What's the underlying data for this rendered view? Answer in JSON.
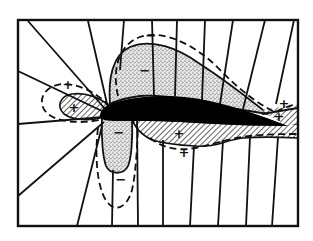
{
  "diagram": {
    "colors": {
      "ink": "#111111",
      "background": "#ffffff",
      "airfoil": "#000000"
    },
    "regions": [
      {
        "id": "upper-suction",
        "pattern": "stipple",
        "sign": "−"
      },
      {
        "id": "lower-front-suction",
        "pattern": "stipple",
        "sign": "−"
      },
      {
        "id": "leading-edge-pressure",
        "pattern": "hatch",
        "sign": "+"
      },
      {
        "id": "lower-pressure",
        "pattern": "hatch",
        "sign": "+"
      },
      {
        "id": "trailing-edge-pressure",
        "pattern": "hatch",
        "sign": "+"
      }
    ],
    "labels": {
      "upper_outer_minus": "−",
      "upper_inner_minus": "−",
      "leading_outer_plus": "+",
      "leading_inner_plus": "+",
      "lower_front_inner_minus": "−",
      "lower_front_outer_minus": "−",
      "lower_inner_plus": "+",
      "lower_outer_plus": "+",
      "trailing_outer_plus": "+",
      "trailing_inner_plus": "+"
    }
  }
}
